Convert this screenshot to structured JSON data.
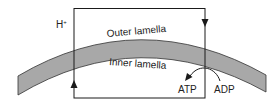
{
  "labels": {
    "proton": "H",
    "proton_charge": "+",
    "outer": "Outer lamella",
    "inner": "Inner lamella",
    "atp": "ATP",
    "adp": "ADP"
  },
  "colors": {
    "line": "#1a1a1a",
    "membrane_fill": "#a8a8a8",
    "background": "#ffffff"
  }
}
